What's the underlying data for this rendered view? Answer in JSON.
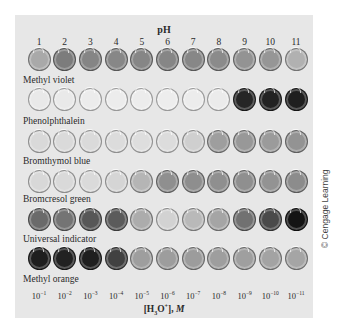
{
  "header": {
    "title": "pH"
  },
  "ph_values": [
    "1",
    "2",
    "3",
    "4",
    "5",
    "6",
    "7",
    "8",
    "9",
    "10",
    "11"
  ],
  "concentrations": [
    {
      "base": "10",
      "exp": "−1"
    },
    {
      "base": "10",
      "exp": "−2"
    },
    {
      "base": "10",
      "exp": "−3"
    },
    {
      "base": "10",
      "exp": "−4"
    },
    {
      "base": "10",
      "exp": "−5"
    },
    {
      "base": "10",
      "exp": "−6"
    },
    {
      "base": "10",
      "exp": "−7"
    },
    {
      "base": "10",
      "exp": "−8"
    },
    {
      "base": "10",
      "exp": "−9"
    },
    {
      "base": "10",
      "exp": "−10"
    },
    {
      "base": "10",
      "exp": "−11"
    }
  ],
  "axis": {
    "species": "[H",
    "sub": "3",
    "mid": "O",
    "sup": "+",
    "close": "], ",
    "unit": "M"
  },
  "indicators": [
    {
      "name": "Methyl violet",
      "colors": [
        "#a9a9a9",
        "#7c7c7c",
        "#858585",
        "#878787",
        "#868686",
        "#868686",
        "#878787",
        "#8b8b8b",
        "#939393",
        "#969696",
        "#b1b1b1"
      ]
    },
    {
      "name": "Phenolphthalein",
      "colors": [
        "#e9e9e9",
        "#e9e9e9",
        "#ececec",
        "#ececec",
        "#ececec",
        "#ededed",
        "#ececec",
        "#ebebeb",
        "#262626",
        "#222222",
        "#1f1f1f"
      ]
    },
    {
      "name": "Bromthymol blue",
      "colors": [
        "#d9d9d9",
        "#dadada",
        "#dadada",
        "#dcdcdc",
        "#dedede",
        "#dcdcdc",
        "#cfcfcf",
        "#9e9e9e",
        "#989898",
        "#9b9b9b",
        "#939393"
      ]
    },
    {
      "name": "Bromcresol green",
      "colors": [
        "#d8d8d8",
        "#d9d9d9",
        "#dadada",
        "#d5d5d5",
        "#b5b5b5",
        "#8f8f8f",
        "#8e8e8e",
        "#8f8f8f",
        "#8f8f8f",
        "#939393",
        "#8c8c8c"
      ]
    },
    {
      "name": "Universal indicator",
      "colors": [
        "#6a6a6a",
        "#747474",
        "#575757",
        "#5b5b5b",
        "#acacac",
        "#d2d2d2",
        "#b9b9b9",
        "#a5a5a5",
        "#717171",
        "#4a4a4a",
        "#141414"
      ]
    },
    {
      "name": "Methyl orange",
      "colors": [
        "#1e1e1e",
        "#222222",
        "#1f1f1f",
        "#414141",
        "#9e9e9e",
        "#9d9d9d",
        "#9c9c9c",
        "#9e9e9e",
        "#9f9f9f",
        "#a3a3a3",
        "#a5a5a5"
      ]
    }
  ],
  "credit": "© Cengage Learning"
}
